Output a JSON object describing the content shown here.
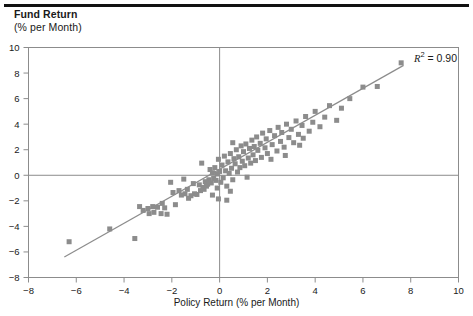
{
  "figure": {
    "y_axis_title_line1": "Fund Return",
    "y_axis_title_line2": "(% per Month)",
    "x_axis_title": "Policy Return (% per Month)",
    "annotation_r_symbol": "R",
    "annotation_exponent": "2",
    "annotation_value": "= 0.90",
    "marker_color": "#8c8c8c",
    "line_color": "#8c8c8c",
    "axis_color": "#8c8c8c",
    "rule_color": "#111111"
  },
  "chart_data": {
    "type": "scatter",
    "title": "",
    "xlabel": "Policy Return (% per Month)",
    "ylabel": "Fund Return (% per Month)",
    "xlim": [
      -8,
      10
    ],
    "ylim": [
      -8,
      10
    ],
    "xticks": [
      -8,
      -6,
      -4,
      -2,
      0,
      2,
      4,
      6,
      8,
      10
    ],
    "yticks": [
      -8,
      -6,
      -4,
      -2,
      0,
      2,
      4,
      6,
      8,
      10
    ],
    "xticklabels": [
      "−8",
      "−6",
      "−4",
      "−2",
      "0",
      "2",
      "4",
      "6",
      "8",
      "10"
    ],
    "yticklabels": [
      "−8",
      "−6",
      "−4",
      "−2",
      "0",
      "2",
      "4",
      "6",
      "8",
      "10"
    ],
    "grid": false,
    "legend": null,
    "annotations": [
      {
        "text": "R2 = 0.90",
        "x": 7.6,
        "y": 9.3,
        "r_squared": 0.9
      }
    ],
    "zero_lines": {
      "vertical_x": 0,
      "horizontal_y": 0
    },
    "trendline": {
      "type": "linear",
      "slope": 1.06,
      "intercept": 0.45,
      "x_start": -6.5,
      "x_end": 7.7,
      "y_start": -6.4,
      "y_end": 8.6
    },
    "marker": {
      "shape": "square",
      "size_px": 5,
      "color": "#8c8c8c"
    },
    "points": [
      [
        -6.3,
        -5.2
      ],
      [
        -4.6,
        -4.2
      ],
      [
        -3.55,
        -4.95
      ],
      [
        -3.35,
        -2.45
      ],
      [
        -3.2,
        -2.75
      ],
      [
        -3.0,
        -2.6
      ],
      [
        -2.95,
        -3.0
      ],
      [
        -2.8,
        -2.45
      ],
      [
        -2.75,
        -2.9
      ],
      [
        -2.6,
        -2.5
      ],
      [
        -2.45,
        -3.0
      ],
      [
        -2.4,
        -2.2
      ],
      [
        -2.3,
        -2.55
      ],
      [
        -2.2,
        -3.05
      ],
      [
        -1.95,
        -1.35
      ],
      [
        -1.85,
        -2.3
      ],
      [
        -1.7,
        -1.2
      ],
      [
        -1.6,
        -1.55
      ],
      [
        -1.45,
        -1.45
      ],
      [
        -1.35,
        -1.1
      ],
      [
        -1.3,
        -1.8
      ],
      [
        -1.2,
        -1.6
      ],
      [
        -1.1,
        -0.65
      ],
      [
        -1.05,
        -1.45
      ],
      [
        -0.95,
        -1.5
      ],
      [
        -0.85,
        -0.75
      ],
      [
        -0.8,
        -1.2
      ],
      [
        -0.75,
        0.95
      ],
      [
        -0.7,
        -0.95
      ],
      [
        -0.65,
        -1.1
      ],
      [
        -0.6,
        -0.5
      ],
      [
        -0.55,
        -0.85
      ],
      [
        -0.5,
        -0.7
      ],
      [
        -0.45,
        -0.35
      ],
      [
        -0.4,
        0.45
      ],
      [
        -0.35,
        -0.6
      ],
      [
        -0.3,
        0.2
      ],
      [
        -0.3,
        -1.55
      ],
      [
        -0.25,
        -0.25
      ],
      [
        -0.2,
        0.6
      ],
      [
        -0.15,
        -0.4
      ],
      [
        -0.1,
        0.1
      ],
      [
        -0.1,
        -1.0
      ],
      [
        -0.05,
        1.25
      ],
      [
        0.0,
        0.3
      ],
      [
        0.05,
        -0.55
      ],
      [
        0.1,
        0.8
      ],
      [
        0.15,
        -0.2
      ],
      [
        0.2,
        1.5
      ],
      [
        0.25,
        0.35
      ],
      [
        0.3,
        -0.85
      ],
      [
        0.35,
        1.05
      ],
      [
        0.4,
        0.15
      ],
      [
        0.45,
        1.7
      ],
      [
        0.5,
        0.55
      ],
      [
        0.55,
        -0.35
      ],
      [
        0.6,
        1.3
      ],
      [
        0.65,
        0.9
      ],
      [
        0.7,
        2.0
      ],
      [
        0.75,
        0.25
      ],
      [
        0.8,
        1.45
      ],
      [
        0.85,
        0.6
      ],
      [
        0.9,
        2.3
      ],
      [
        0.95,
        1.1
      ],
      [
        1.0,
        1.85
      ],
      [
        1.05,
        0.75
      ],
      [
        1.1,
        2.45
      ],
      [
        1.2,
        1.35
      ],
      [
        1.25,
        2.1
      ],
      [
        1.3,
        0.95
      ],
      [
        1.35,
        2.75
      ],
      [
        1.4,
        1.6
      ],
      [
        1.45,
        2.25
      ],
      [
        1.5,
        1.15
      ],
      [
        1.55,
        3.0
      ],
      [
        1.6,
        1.95
      ],
      [
        1.7,
        2.5
      ],
      [
        1.75,
        1.4
      ],
      [
        1.8,
        3.3
      ],
      [
        1.9,
        2.15
      ],
      [
        1.95,
        2.85
      ],
      [
        2.0,
        1.7
      ],
      [
        2.1,
        3.5
      ],
      [
        2.2,
        2.4
      ],
      [
        2.3,
        3.1
      ],
      [
        2.4,
        1.9
      ],
      [
        2.45,
        3.75
      ],
      [
        2.55,
        2.65
      ],
      [
        2.6,
        3.35
      ],
      [
        2.7,
        2.2
      ],
      [
        2.8,
        4.0
      ],
      [
        2.9,
        2.95
      ],
      [
        3.0,
        3.6
      ],
      [
        3.1,
        2.55
      ],
      [
        3.2,
        4.25
      ],
      [
        3.3,
        3.2
      ],
      [
        3.45,
        3.9
      ],
      [
        3.5,
        2.9
      ],
      [
        3.6,
        4.6
      ],
      [
        3.75,
        3.45
      ],
      [
        3.9,
        4.15
      ],
      [
        4.0,
        5.0
      ],
      [
        4.2,
        3.8
      ],
      [
        4.4,
        4.55
      ],
      [
        4.6,
        5.45
      ],
      [
        4.9,
        4.3
      ],
      [
        5.1,
        5.25
      ],
      [
        5.45,
        6.0
      ],
      [
        6.0,
        6.9
      ],
      [
        6.6,
        6.95
      ],
      [
        7.6,
        8.8
      ],
      [
        -2.05,
        -0.55
      ],
      [
        -1.5,
        -0.3
      ],
      [
        0.55,
        2.55
      ],
      [
        1.15,
        -0.15
      ],
      [
        2.15,
        1.25
      ],
      [
        0.45,
        -1.25
      ],
      [
        -0.05,
        -1.85
      ],
      [
        0.3,
        -1.95
      ],
      [
        2.75,
        1.55
      ],
      [
        3.35,
        2.35
      ]
    ]
  }
}
